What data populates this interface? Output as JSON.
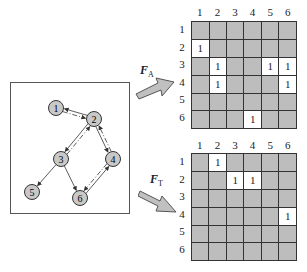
{
  "graph": {
    "nodes": [
      {
        "id": "1",
        "x": 45,
        "y": 25
      },
      {
        "id": "2",
        "x": 83,
        "y": 36
      },
      {
        "id": "3",
        "x": 50,
        "y": 76
      },
      {
        "id": "4",
        "x": 102,
        "y": 76
      },
      {
        "id": "5",
        "x": 21,
        "y": 109
      },
      {
        "id": "6",
        "x": 69,
        "y": 115
      }
    ],
    "solid_edges": [
      [
        "2",
        "1"
      ],
      [
        "2",
        "3"
      ],
      [
        "2",
        "4"
      ],
      [
        "3",
        "5"
      ],
      [
        "3",
        "6"
      ],
      [
        "6",
        "4"
      ]
    ],
    "dashed_edges": [
      [
        "1",
        "2"
      ],
      [
        "3",
        "2"
      ],
      [
        "4",
        "2"
      ],
      [
        "4",
        "6"
      ]
    ]
  },
  "labels": {
    "fa_main": "F",
    "fa_sub": "A",
    "ft_main": "F",
    "ft_sub": "T"
  },
  "matrices": {
    "column_labels": [
      "1",
      "2",
      "3",
      "4",
      "5",
      "6"
    ],
    "row_labels": [
      "1",
      "2",
      "3",
      "4",
      "5",
      "6"
    ],
    "fa": [
      [
        "",
        "",
        "",
        "",
        "",
        ""
      ],
      [
        "1",
        "",
        "",
        "",
        "",
        ""
      ],
      [
        "",
        "1",
        "",
        "",
        "1",
        "1"
      ],
      [
        "",
        "1",
        "",
        "",
        "",
        "1"
      ],
      [
        "",
        "",
        "",
        "",
        "",
        ""
      ],
      [
        "",
        "",
        "",
        "1",
        "",
        ""
      ]
    ],
    "ft": [
      [
        "",
        "1",
        "",
        "",
        "",
        ""
      ],
      [
        "",
        "",
        "1",
        "1",
        "",
        ""
      ],
      [
        "",
        "",
        "",
        "",
        "",
        ""
      ],
      [
        "",
        "",
        "",
        "",
        "",
        "1"
      ],
      [
        "",
        "",
        "",
        "",
        "",
        ""
      ],
      [
        "",
        "",
        "",
        "",
        "",
        ""
      ]
    ]
  },
  "colors": {
    "cell_off": "#bdbdbd",
    "cell_on": "#ffffff",
    "node_fill": "#c8c8c8",
    "arrow_fill": "#c0c0c0"
  }
}
